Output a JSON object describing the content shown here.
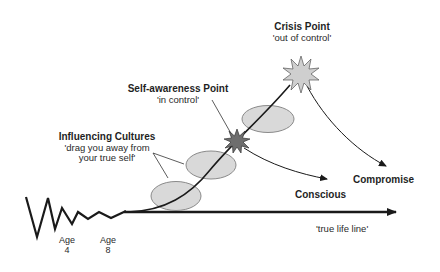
{
  "diagram": {
    "crisis_point": {
      "title": "Crisis Point",
      "subtitle": "'out of control'"
    },
    "self_awareness_point": {
      "title": "Self-awareness Point",
      "subtitle": "'in control'"
    },
    "influencing_cultures": {
      "title": "Influencing Cultures",
      "line1": "'drag you away from",
      "line2": "your true self'"
    },
    "outcomes": {
      "conscious": "Conscious",
      "compromise": "Compromise"
    },
    "true_life_line": "'true life line'",
    "ages": [
      {
        "label": "Age",
        "value": "4"
      },
      {
        "label": "Age",
        "value": "8"
      }
    ],
    "colors": {
      "line": "#1a1a1a",
      "ellipse_fill": "#d9d9d9",
      "ellipse_stroke": "#8a8a8a",
      "crisis_star_fill": "#cfcfcf",
      "self_awareness_star_fill": "#6e6e6e"
    }
  }
}
